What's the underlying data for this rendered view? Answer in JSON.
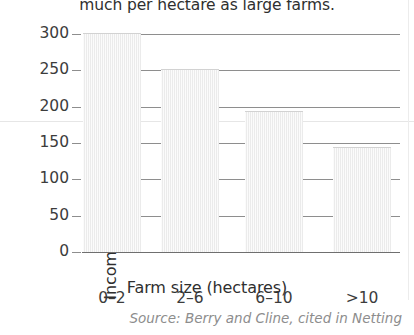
{
  "caption": {
    "top_text_clipped": "much per hectare as large farms."
  },
  "source": {
    "note": "Source: Berry and Cline, cited in Netting"
  },
  "chart_data": {
    "type": "bar",
    "title": "",
    "xlabel": "Farm size (hectares)",
    "ylabel": "Income per hectare (rupees)",
    "categories": [
      "0–2",
      "2–6",
      "6–10",
      ">10"
    ],
    "values": [
      300,
      250,
      193,
      143
    ],
    "ylim": [
      0,
      300
    ],
    "yticks": [
      0,
      50,
      100,
      150,
      200,
      250,
      300
    ],
    "ytick_labels": [
      "0",
      "50",
      "100",
      "150",
      "200",
      "250",
      "300"
    ],
    "grid": true,
    "legend": false,
    "bar_fill_color": "#eeeeee",
    "axis_color": "#8e8e8e",
    "text_color": "#3c3c3c"
  }
}
